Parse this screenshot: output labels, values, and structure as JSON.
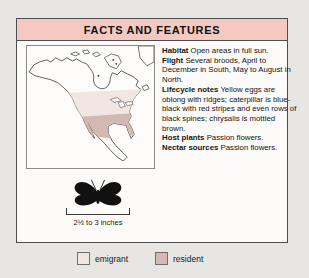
{
  "header": {
    "title": "FACTS AND FEATURES"
  },
  "facts": [
    {
      "label": "Habitat",
      "text": "Open areas in full sun."
    },
    {
      "label": "Flight",
      "text": "Several broods, April to December in South, May to August in North."
    },
    {
      "label": "Lifecycle notes",
      "text": "Yellow eggs are oblong with ridges; caterpillar is blue-black with red stripes and even rows of black spines; chrysalis is mottled brown."
    },
    {
      "label": "Host plants",
      "text": "Passion flowers."
    },
    {
      "label": "Nectar sources",
      "text": "Passion flowers."
    }
  ],
  "map": {
    "subject": "north-america-range-map",
    "regions": [
      {
        "name": "emigrant",
        "color": "#f2e6e0"
      },
      {
        "name": "resident",
        "color": "#d4b8b2"
      }
    ]
  },
  "size_scale": {
    "label": "2½ to 3 inches"
  },
  "legend": {
    "items": [
      {
        "label": "emigrant",
        "color": "#f2e6e0"
      },
      {
        "label": "resident",
        "color": "#d4b8b2"
      }
    ]
  },
  "colors": {
    "header_bg": "#f3c9c2",
    "page_bg": "#e7e6e2",
    "card_bg": "#fcfbf9",
    "butterfly": "#111111"
  }
}
